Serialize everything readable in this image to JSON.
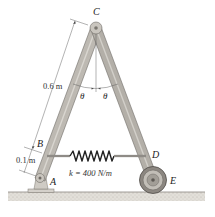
{
  "diagram": {
    "type": "mechanism",
    "points": {
      "A": "A",
      "B": "B",
      "C": "C",
      "D": "D",
      "E": "E"
    },
    "angle_left": "θ",
    "angle_right": "θ",
    "dimension_upper": "0.6 m",
    "dimension_lower": "0.1 m",
    "spring_label": "k = 400 N/m",
    "colors": {
      "member": "#b9b5ae",
      "member_edge": "#6f6b66",
      "wheel": "#8c8781",
      "ground": "#d8d5cf"
    }
  }
}
